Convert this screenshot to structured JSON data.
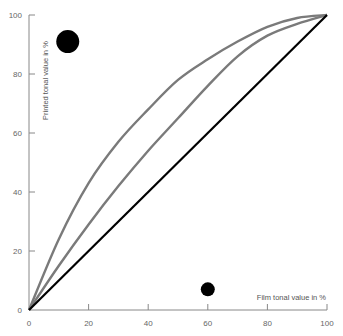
{
  "chart_data": {
    "type": "line",
    "title": "",
    "xlabel": "Film tonal value in %",
    "ylabel": "Printed tonal value in %",
    "xlim": [
      0,
      100
    ],
    "ylim": [
      0,
      100
    ],
    "x_ticks": [
      "0",
      "20",
      "40",
      "60",
      "80",
      "100"
    ],
    "y_ticks": [
      "0",
      "20",
      "40",
      "60",
      "80",
      "100"
    ],
    "grid": false,
    "legend": null,
    "series": [
      {
        "name": "upper curve",
        "color": "#7a7a7a",
        "x": [
          0,
          10,
          20,
          30,
          40,
          50,
          60,
          70,
          80,
          90,
          100
        ],
        "y": [
          0,
          24,
          43,
          57,
          68,
          78,
          85,
          91,
          96,
          99,
          100
        ]
      },
      {
        "name": "middle curve",
        "color": "#7a7a7a",
        "x": [
          0,
          10,
          20,
          30,
          40,
          50,
          60,
          70,
          80,
          90,
          100
        ],
        "y": [
          0,
          15,
          29,
          42,
          54,
          65,
          76,
          86,
          93,
          97,
          100
        ]
      },
      {
        "name": "linear reference",
        "color": "#000000",
        "x": [
          0,
          100
        ],
        "y": [
          0,
          100
        ]
      }
    ],
    "annotations": [
      {
        "type": "dot",
        "size": "large",
        "x": 13,
        "y": 91
      },
      {
        "type": "dot",
        "size": "small",
        "x": 60,
        "y": 7
      }
    ]
  }
}
